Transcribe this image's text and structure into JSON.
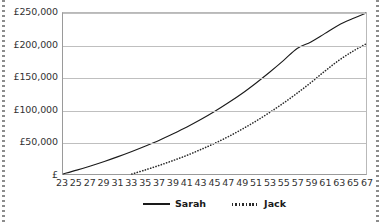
{
  "chart_data": {
    "type": "line",
    "title": "",
    "xlabel": "",
    "ylabel": "",
    "grid": true,
    "legend_position": "bottom-center",
    "currency_symbol": "£",
    "xlim": [
      23,
      67
    ],
    "ylim": [
      0,
      250000
    ],
    "x_tick_labels": [
      "23",
      "25",
      "27",
      "29",
      "31",
      "33",
      "35",
      "37",
      "39",
      "41",
      "43",
      "45",
      "47",
      "49",
      "51",
      "53",
      "55",
      "57",
      "59",
      "61",
      "63",
      "65",
      "67"
    ],
    "x_ticks": [
      23,
      25,
      27,
      29,
      31,
      33,
      35,
      37,
      39,
      41,
      43,
      45,
      47,
      49,
      51,
      53,
      55,
      57,
      59,
      61,
      63,
      65,
      67
    ],
    "y_tick_labels": [
      "£",
      "£50,000",
      "£100,000",
      "£150,000",
      "£200,000",
      "£250,000"
    ],
    "y_ticks": [
      0,
      50000,
      100000,
      150000,
      200000,
      250000
    ],
    "series": [
      {
        "name": "Sarah",
        "style": "solid",
        "color": "#1a1a1a",
        "x": [
          23,
          25,
          27,
          29,
          31,
          33,
          35,
          37,
          39,
          41,
          43,
          45,
          47,
          49,
          51,
          53,
          55,
          57,
          59,
          61,
          63,
          65,
          67
        ],
        "values": [
          0,
          6000,
          12500,
          19500,
          27000,
          35000,
          43500,
          52500,
          62500,
          73000,
          84500,
          97000,
          110500,
          125000,
          141000,
          158000,
          176000,
          195000,
          205000,
          218000,
          231000,
          241000,
          250000
        ]
      },
      {
        "name": "Jack",
        "style": "dotted",
        "color": "#2a2a2a",
        "x": [
          33,
          35,
          37,
          39,
          41,
          43,
          45,
          47,
          49,
          51,
          53,
          55,
          57,
          59,
          61,
          63,
          65,
          67
        ],
        "values": [
          0,
          6500,
          13500,
          21000,
          29000,
          38000,
          47500,
          58000,
          69500,
          82000,
          95500,
          110000,
          125500,
          142000,
          159500,
          176000,
          190000,
          202000
        ]
      }
    ]
  },
  "legend": {
    "items": [
      {
        "label": "Sarah",
        "style": "solid"
      },
      {
        "label": "Jack",
        "style": "dotted"
      }
    ]
  }
}
